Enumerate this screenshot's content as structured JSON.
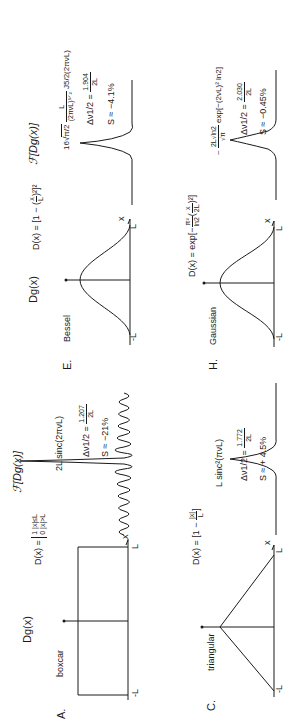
{
  "figure": {
    "orientation": "rotated 90 degrees counter-clockwise",
    "panels": [
      {
        "id": "A",
        "letter": "A.",
        "name": "boxcar",
        "function_title": "Dg(x)",
        "definition": "D(x) = { 1 |x|≤L ; 0 |x|>L }",
        "definition_lhs": "D(x) =",
        "definition_case1": "1  |x|≤L",
        "definition_case2": "0  |x|>L",
        "axis_left": "-L",
        "axis_right": "L",
        "axis_var": "x",
        "transform_title": "ℱ[Dg(x)]",
        "transform_formula": "2L sinc(2πνL)",
        "fwhm_lhs": "Δν1/2 =",
        "fwhm_num": "1.207",
        "fwhm_den": "2L",
        "sidelobe": "S ≈ −21%"
      },
      {
        "id": "C",
        "letter": "C.",
        "name": "triangular",
        "function_title": "",
        "definition": "D(x) = [1 − |x|/L]",
        "definition_lhs": "D(x) = [1 −",
        "definition_num": "|x|",
        "definition_den": "L",
        "definition_rhs": "]",
        "axis_left": "-L",
        "axis_right": "L",
        "axis_var": "x",
        "transform_formula": "L sinc²(πνL)",
        "fwhm_lhs": "Δν1/2 =",
        "fwhm_num": "1.772",
        "fwhm_den": "2L",
        "sidelobe": "S ≈ + 4.5%"
      },
      {
        "id": "E",
        "letter": "E.",
        "name": "Bessel",
        "function_title": "Dg(x)",
        "definition": "D(x) = [1 − (x/L)²]²",
        "definition_lhs": "D(x) = [1 − (",
        "definition_num": "x",
        "definition_den": "L",
        "definition_rhs": ")²]²",
        "axis_left": "-L",
        "axis_right": "L",
        "axis_var": "x",
        "transform_title": "ℱ[Dg(x)]",
        "transform_formula": "16 √(π/2) · L/(2πνL)^(5/2) · J5/2(2πνL)",
        "transform_coef": "16",
        "transform_sqrt": "π/2",
        "transform_num": "L",
        "transform_den": "(2πνL)⁵ᐟ²",
        "transform_bessel": "J5/2(2πνL)",
        "fwhm_lhs": "Δν1/2 =",
        "fwhm_num": "1.904",
        "fwhm_den": "2L",
        "sidelobe": "S ≈ −4.1%"
      },
      {
        "id": "H",
        "letter": "H.",
        "name": "Gaussian",
        "function_title": "",
        "definition": "D(x) = exp[−(π²/ln2)(x/2L)²]",
        "definition_lhs": "D(x) = exp[−",
        "definition_num": "π²",
        "definition_den": "ln2",
        "definition_mid": "(",
        "definition_num2": "x",
        "definition_den2": "2L",
        "definition_rhs": ")²]",
        "axis_left": "-L",
        "axis_right": "L",
        "axis_var": "x",
        "transform_formula": "~ (2L√ln2 / √π) exp[−(2νL)² ln2]",
        "transform_prefix": "~",
        "transform_num": "2L√ln2",
        "transform_den": "√π",
        "transform_exp": "exp[−(2νL)² ln2]",
        "fwhm_lhs": "Δν1/2 =",
        "fwhm_num": "2.030",
        "fwhm_den": "2L",
        "sidelobe": "S ≈ −0.45%"
      }
    ]
  }
}
